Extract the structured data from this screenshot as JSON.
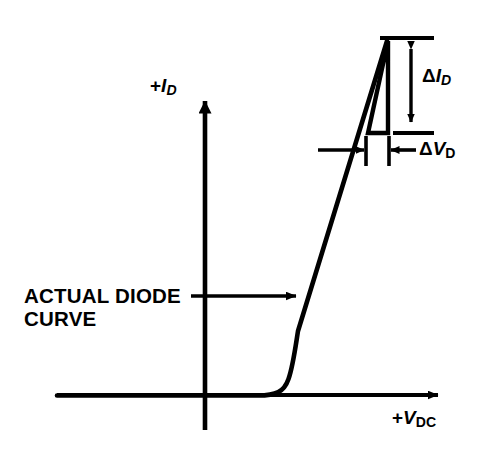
{
  "figure": {
    "kind": "diode-iv-characteristic-diagram",
    "background_color": "#ffffff",
    "stroke_color": "#000000",
    "width": 481,
    "height": 458
  },
  "axes": {
    "y_axis": {
      "label_prefix": "+",
      "label_symbol": "I",
      "label_subscript": "D",
      "label_full": "+ID",
      "arrow_direction": "up",
      "origin_x": 205,
      "tip_y": 88,
      "base_y": 430
    },
    "x_axis": {
      "label_prefix": "+",
      "label_symbol": "V",
      "label_subscript": "DC",
      "label_full": "+VDC",
      "arrow_direction": "right",
      "origin_y": 395,
      "start_x": 57,
      "tip_x": 450
    }
  },
  "curve": {
    "name": "actual-diode-curve",
    "callout_line1": "ACTUAL DIODE",
    "callout_line2": "CURVE",
    "callout_full": "ACTUAL DIODE CURVE",
    "knee_x": 288,
    "top_x": 388,
    "top_y": 38
  },
  "annotations": {
    "delta_id": {
      "symbol": "Δ",
      "variable": "I",
      "subscript": "D",
      "label_full": "ΔID",
      "dimension_top_y": 38,
      "dimension_bottom_y": 133,
      "dimension_x": 410
    },
    "delta_vd": {
      "symbol": "Δ",
      "variable": "V",
      "subscript": "D",
      "label_full": "ΔVD",
      "dimension_left_x": 365,
      "dimension_right_x": 388,
      "dimension_y": 150
    },
    "tangent_triangle": {
      "apex_x": 388,
      "apex_y": 40,
      "base_left_x": 368,
      "base_y": 133
    }
  }
}
